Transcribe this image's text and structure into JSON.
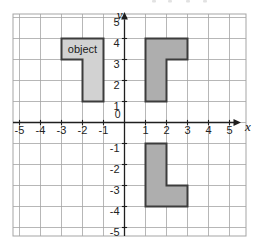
{
  "figure": {
    "type": "coordinate-plane-diagram",
    "x_axis_label": "x",
    "y_axis_label": "y",
    "origin_label": "0",
    "x_tick_labels": [
      "-5",
      "-4",
      "-3",
      "-2",
      "-1",
      "1",
      "2",
      "3",
      "4",
      "5"
    ],
    "y_tick_labels": [
      "5",
      "4",
      "3",
      "2",
      "1",
      "-1",
      "-2",
      "-3",
      "-4",
      "-5"
    ],
    "x_range": [
      -5,
      5
    ],
    "y_range": [
      -5,
      5
    ],
    "grid": "on",
    "top_edge_artifact": "faint cropped text fragment at top edge"
  },
  "shapes": [
    {
      "id": "object-shape",
      "label": "object",
      "fill": "#d2d2d2",
      "stroke": "#3c3c3c",
      "vertices": [
        [
          -3,
          4
        ],
        [
          -1,
          4
        ],
        [
          -1,
          1
        ],
        [
          -2,
          1
        ],
        [
          -2,
          3
        ],
        [
          -3,
          3
        ]
      ],
      "label_position": [
        -2,
        3.3
      ]
    },
    {
      "id": "image-upper-right-shape",
      "label": "",
      "fill": "#aeaeae",
      "stroke": "#3c3c3c",
      "vertices": [
        [
          1,
          4
        ],
        [
          3,
          4
        ],
        [
          3,
          3
        ],
        [
          2,
          3
        ],
        [
          2,
          1
        ],
        [
          1,
          1
        ]
      ]
    },
    {
      "id": "image-lower-right-shape",
      "label": "",
      "fill": "#aeaeae",
      "stroke": "#3c3c3c",
      "vertices": [
        [
          1,
          -1
        ],
        [
          2,
          -1
        ],
        [
          2,
          -3
        ],
        [
          3,
          -3
        ],
        [
          3,
          -4
        ],
        [
          1,
          -4
        ]
      ]
    }
  ],
  "colors": {
    "background": "#ffffff",
    "grid_line": "#a5a5a5",
    "axis": "#1f1f1f",
    "tick_text": "#222222",
    "axis_letter": "#111111",
    "object_fill": "#d2d2d2",
    "image_fill": "#aeaeae",
    "shape_border": "#3c3c3c",
    "object_label_text": "#1a1a1a"
  }
}
